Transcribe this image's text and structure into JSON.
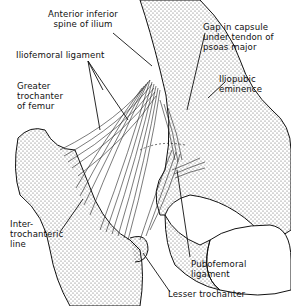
{
  "figure": {
    "labels": {
      "anterior_inferior_spine": "Anterior inferior\nspine of ilium",
      "iliofemoral_ligament": "Iliofemoral ligament",
      "greater_trochanter": "Greater\ntrochanter\nof femur",
      "gap_in_capsule": "Gap in capsule\nunder tendon of\npsoas major",
      "iliopubic_eminence": "Iliopubic\neminence",
      "intertrochanteric_line": "Inter-\ntrochanteric\nline",
      "pubofemoral_ligament": "Pubofemoral\nligament",
      "lesser_trochanter": "Lesser trochanter"
    },
    "colors": {
      "ink": "#111111",
      "background": "#ffffff",
      "stipple": "#555555"
    }
  }
}
